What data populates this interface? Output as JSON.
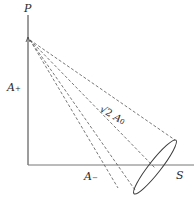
{
  "diagram": {
    "axes": {
      "vertical_label": "P",
      "horizontal_label": "S"
    },
    "labels": {
      "a_plus": {
        "base": "A",
        "sub": "+"
      },
      "a_minus": {
        "base": "A",
        "sub": "−"
      },
      "sqrt2_a0": {
        "prefix": "√2 ",
        "base": "A",
        "sub": "0"
      }
    },
    "colors": {
      "line": "#3a3a3a",
      "dashed": "#555555",
      "axis_gray": "#888888"
    }
  }
}
